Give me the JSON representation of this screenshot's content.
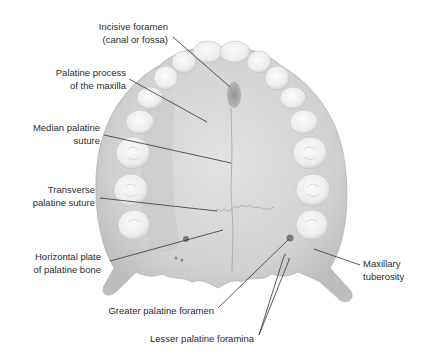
{
  "figure": {
    "colors": {
      "background": "#ffffff",
      "bone": "#d8d8d6",
      "bone_shadow": "#b9b9b7",
      "tooth": "#f1f1f0",
      "tooth_shadow": "#c9c9c8",
      "foramen": "#8a8a88",
      "leader_line": "#333333",
      "text": "#2b2b2b"
    },
    "labels": [
      {
        "id": "incisive-foramen",
        "lines": [
          "Incisive foramen",
          "(canal or fossa)"
        ]
      },
      {
        "id": "palatine-process",
        "lines": [
          "Palatine process",
          "of the maxilla"
        ]
      },
      {
        "id": "median-palatine-suture",
        "lines": [
          "Median palatine",
          "suture"
        ]
      },
      {
        "id": "transverse-palatine-suture",
        "lines": [
          "Transverse",
          "palatine suture"
        ]
      },
      {
        "id": "horizontal-plate",
        "lines": [
          "Horizontal plate",
          "of palatine bone"
        ]
      },
      {
        "id": "greater-palatine-foramen",
        "lines": [
          "Greater palatine foramen"
        ]
      },
      {
        "id": "lesser-palatine-foramina",
        "lines": [
          "Lesser palatine foramina"
        ]
      },
      {
        "id": "maxillary-tuberosity",
        "lines": [
          "Maxillary",
          "tuberosity"
        ]
      }
    ]
  }
}
